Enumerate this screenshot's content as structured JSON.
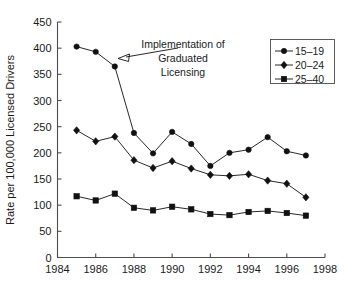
{
  "chart_data": {
    "type": "line",
    "title": "",
    "xlabel": "",
    "ylabel": "Rate per 100,000 Licensed Drivers",
    "xlim": [
      1984,
      1998
    ],
    "ylim": [
      0,
      450
    ],
    "xticks": [
      1984,
      1986,
      1988,
      1990,
      1992,
      1994,
      1996,
      1998
    ],
    "yticks": [
      0,
      50,
      100,
      150,
      200,
      250,
      300,
      350,
      400,
      450
    ],
    "grid": false,
    "legend_position": "top-right",
    "x": [
      1985,
      1986,
      1987,
      1988,
      1989,
      1990,
      1991,
      1992,
      1993,
      1994,
      1995,
      1996,
      1997
    ],
    "series": [
      {
        "name": "15–19",
        "marker": "circle",
        "values": [
          403,
          393,
          365,
          238,
          199,
          240,
          217,
          175,
          200,
          206,
          230,
          203,
          195
        ]
      },
      {
        "name": "20–24",
        "marker": "diamond",
        "values": [
          243,
          222,
          231,
          186,
          171,
          184,
          170,
          158,
          156,
          159,
          147,
          141,
          115
        ]
      },
      {
        "name": "25–40",
        "marker": "square",
        "values": [
          117,
          109,
          122,
          95,
          90,
          97,
          92,
          83,
          81,
          87,
          89,
          85,
          80
        ]
      }
    ],
    "annotations": [
      {
        "name": "graduated-licensing-note",
        "lines": [
          "Implementation of",
          "Graduated",
          "Licensing"
        ],
        "points_to_x": 1987,
        "points_to_y": 365
      }
    ],
    "colors": {
      "line": "#111111",
      "marker": "#111111",
      "axis": "#4d4d4d",
      "text": "#1a1a1a",
      "background": "#ffffff"
    }
  },
  "legend": {
    "entries": [
      {
        "label": "15–19",
        "marker": "circle"
      },
      {
        "label": "20–24",
        "marker": "diamond"
      },
      {
        "label": "25–40",
        "marker": "square"
      }
    ]
  },
  "axes": {
    "y_title": "Rate per 100,000 Licensed Drivers",
    "y_tick_labels": [
      "0",
      "50",
      "100",
      "150",
      "200",
      "250",
      "300",
      "350",
      "400",
      "450"
    ],
    "x_tick_labels": [
      "1984",
      "1986",
      "1988",
      "1990",
      "1992",
      "1994",
      "1996",
      "1998"
    ]
  },
  "annotation": {
    "line1": "Implementation of",
    "line2": "Graduated",
    "line3": "Licensing"
  }
}
